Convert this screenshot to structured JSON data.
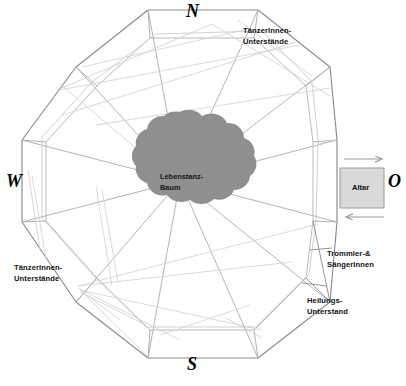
{
  "diagram": {
    "colors": {
      "background": "#ffffff",
      "outline": "#8c8c8c",
      "inner_line": "#b2b2b2",
      "faint_line": "#cfcfcf",
      "tree_fill": "#8f8f8f",
      "altar_fill": "#d9d9d9",
      "altar_border": "#9a9a9a",
      "text": "#111111",
      "arrow": "#9a9a9a"
    },
    "center": {
      "name": "tree-canopy",
      "label": "Lebenstanz-\nBaum"
    },
    "compass": [
      {
        "key": "north",
        "label": "N",
        "x": 186,
        "y": 3
      },
      {
        "key": "west",
        "label": "W",
        "x": 6,
        "y": 178
      },
      {
        "key": "east",
        "label": "O",
        "x": 389,
        "y": 178
      },
      {
        "key": "south",
        "label": "S",
        "x": 187,
        "y": 357
      }
    ],
    "altar": {
      "label": "Altar",
      "x": 340,
      "y": 168,
      "w": 44,
      "h": 40
    },
    "arrows": [
      {
        "name": "altar-arrow-in",
        "direction": "right",
        "y": 159,
        "x1": 343,
        "x2": 384
      },
      {
        "name": "altar-arrow-out",
        "direction": "left",
        "y": 217,
        "x1": 384,
        "x2": 343
      }
    ],
    "labels": [
      {
        "key": "dancer-shelters-ne",
        "text": "TänzerInnen-\nUnterstände",
        "x": 243,
        "y": 26
      },
      {
        "key": "dancer-shelters-sw",
        "text": "TänzerInnen-\nUnterstände",
        "x": 14,
        "y": 263
      },
      {
        "key": "drummers-singers",
        "text": "Trommler-&\nSängerInnen",
        "x": 327,
        "y": 249
      },
      {
        "key": "healing-shelter",
        "text": "Heilungs-\nUnterstand",
        "x": 307,
        "y": 296
      }
    ],
    "geometry": {
      "outer_polygon": "186,9 262,16 323,60 337,133 337,224 322,297 262,356 186,362 110,356 50,297 22,224 22,133 50,60 110,16",
      "shape": "decagon",
      "spoke_count": 10,
      "shelter_sections": 10
    }
  }
}
